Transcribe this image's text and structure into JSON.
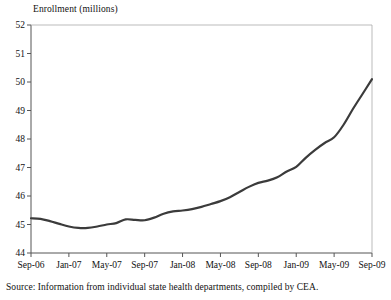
{
  "chart_data": {
    "type": "line",
    "title": "Enrollment (millions)",
    "xlabel": "",
    "ylabel": "Enrollment (millions)",
    "ylim": [
      44,
      52
    ],
    "ytick_values": [
      44,
      45,
      46,
      47,
      48,
      49,
      50,
      51,
      52
    ],
    "ytick_labels": [
      "44",
      "45",
      "46",
      "47",
      "48",
      "49",
      "50",
      "51",
      "52"
    ],
    "xtick_labels": [
      "Sep-06",
      "Jan-07",
      "May-07",
      "Sep-07",
      "Jan-08",
      "May-08",
      "Sep-08",
      "Jan-09",
      "May-09",
      "Sep-09"
    ],
    "grid": false,
    "legend": "none",
    "line_color": "#3b3b3b",
    "line_width": 2.2,
    "x": [
      "Sep-06",
      "Oct-06",
      "Nov-06",
      "Dec-06",
      "Jan-07",
      "Feb-07",
      "Mar-07",
      "Apr-07",
      "May-07",
      "Jun-07",
      "Jul-07",
      "Aug-07",
      "Sep-07",
      "Oct-07",
      "Nov-07",
      "Dec-07",
      "Jan-08",
      "Feb-08",
      "Mar-08",
      "Apr-08",
      "May-08",
      "Jun-08",
      "Jul-08",
      "Aug-08",
      "Sep-08",
      "Oct-08",
      "Nov-08",
      "Dec-08",
      "Jan-09",
      "Feb-09",
      "Mar-09",
      "Apr-09",
      "May-09",
      "Jun-09",
      "Jul-09",
      "Aug-09",
      "Sep-09"
    ],
    "values": [
      45.22,
      45.2,
      45.12,
      45.02,
      44.93,
      44.88,
      44.88,
      44.93,
      45.0,
      45.02,
      45.1,
      45.2,
      45.15,
      45.18,
      45.28,
      45.42,
      45.48,
      45.5,
      45.56,
      45.64,
      45.72,
      45.8,
      45.94,
      46.1,
      46.28,
      46.44,
      46.52,
      46.62,
      46.82,
      47.02,
      47.3,
      47.6,
      47.88,
      48.1,
      48.48,
      48.98,
      49.4
    ],
    "values_tail": [
      49.9,
      50.35,
      50.72,
      51.08
    ],
    "series_full": {
      "name": "Enrollment",
      "months": [
        "Sep-06",
        "Oct-06",
        "Nov-06",
        "Dec-06",
        "Jan-07",
        "Feb-07",
        "Mar-07",
        "Apr-07",
        "May-07",
        "Jun-07",
        "Jul-07",
        "Aug-07",
        "Sep-07",
        "Oct-07",
        "Nov-07",
        "Dec-07",
        "Jan-08",
        "Feb-08",
        "Mar-08",
        "Apr-08",
        "May-08",
        "Jun-08",
        "Jul-08",
        "Aug-08",
        "Sep-08",
        "Oct-08",
        "Nov-08",
        "Dec-08",
        "Jan-09",
        "Feb-09",
        "Mar-09",
        "Apr-09",
        "May-09",
        "Jun-09",
        "Jul-09",
        "Aug-09",
        "Sep-09"
      ],
      "enrollment": [
        45.22,
        45.2,
        45.12,
        45.02,
        44.93,
        44.88,
        44.88,
        44.93,
        45.0,
        45.05,
        45.18,
        45.16,
        45.15,
        45.24,
        45.38,
        45.46,
        45.49,
        45.54,
        45.62,
        45.72,
        45.82,
        45.96,
        46.14,
        46.32,
        46.46,
        46.54,
        46.66,
        46.86,
        47.02,
        47.34,
        47.62,
        47.86,
        48.06,
        48.5,
        49.06,
        49.58,
        50.1
      ]
    }
  },
  "source": {
    "label": "Source:",
    "text": "Source:  Information from individual state health departments, compiled by CEA."
  }
}
